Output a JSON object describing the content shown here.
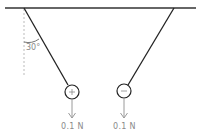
{
  "diagram": {
    "angle_label": "30°",
    "left_charge": {
      "sign": "+",
      "force_label": "0.1 N"
    },
    "right_charge": {
      "sign": "−",
      "force_label": "0.1 N"
    },
    "colors": {
      "line": "#222222",
      "arrow": "#9a9a9a",
      "dashed": "#bbbbbb",
      "text": "#8a8a8a"
    }
  }
}
